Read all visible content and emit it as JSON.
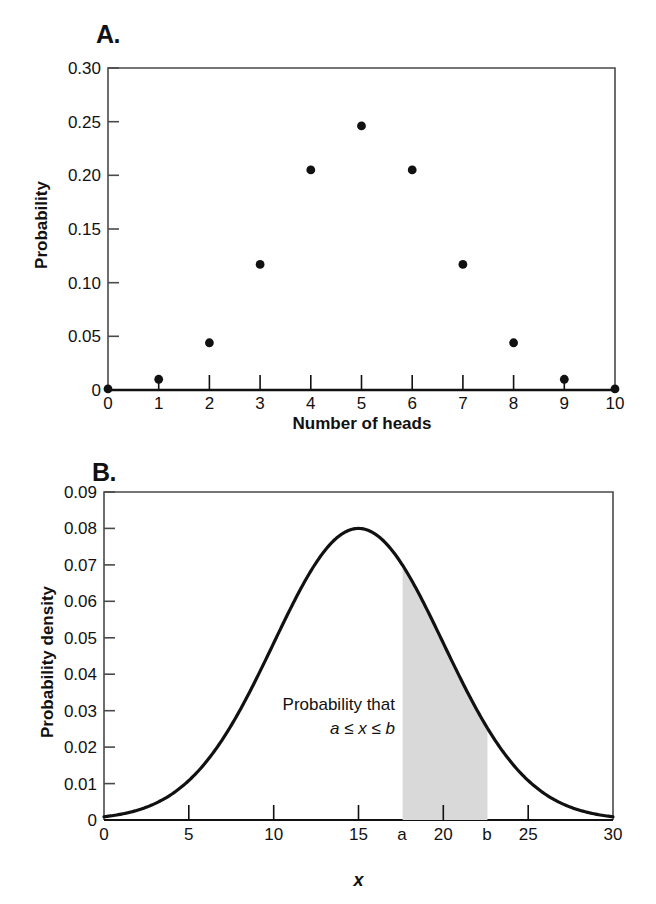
{
  "figure": {
    "panels": [
      {
        "id": "A",
        "label": "A."
      },
      {
        "id": "B",
        "label": "B."
      }
    ]
  },
  "chart_data": [
    {
      "type": "scatter",
      "panel": "A",
      "title": "A.",
      "xlabel": "Number of heads",
      "ylabel": "Probability",
      "xlim": [
        0,
        10
      ],
      "ylim": [
        0,
        0.3
      ],
      "grid": false,
      "legend": "none",
      "x_ticks": [
        "0",
        "1",
        "2",
        "3",
        "4",
        "5",
        "6",
        "7",
        "8",
        "9",
        "10"
      ],
      "y_ticks": [
        "0",
        "0.05",
        "0.10",
        "0.15",
        "0.20",
        "0.25",
        "0.30"
      ],
      "x": [
        0,
        1,
        2,
        3,
        4,
        5,
        6,
        7,
        8,
        9,
        10
      ],
      "values": [
        0.001,
        0.01,
        0.044,
        0.117,
        0.205,
        0.246,
        0.205,
        0.117,
        0.044,
        0.01,
        0.001
      ],
      "marker": "filled-circle",
      "marker_color": "#111111"
    },
    {
      "type": "line",
      "panel": "B",
      "title": "B.",
      "xlabel": "x",
      "ylabel": "Probability density",
      "xlim": [
        0,
        30
      ],
      "ylim": [
        0,
        0.09
      ],
      "grid": false,
      "legend": "none",
      "x_ticks": [
        "0",
        "5",
        "10",
        "15",
        "a",
        "20",
        "b",
        "25",
        "30"
      ],
      "x_tick_values": [
        0,
        5,
        10,
        15,
        17.6,
        20,
        22.6,
        25,
        30
      ],
      "y_ticks": [
        "0",
        "0.01",
        "0.02",
        "0.03",
        "0.04",
        "0.05",
        "0.06",
        "0.07",
        "0.08",
        "0.09"
      ],
      "curve": {
        "distribution": "normal",
        "mean": 15,
        "sigma": 5,
        "peak": 0.08,
        "color": "#111111"
      },
      "shaded_region": {
        "from": 17.6,
        "to": 22.6,
        "from_label": "a",
        "to_label": "b",
        "fill": "#d9d9d9"
      },
      "annotations": [
        {
          "line1": "Probability that",
          "line2": "a ≤ x ≤ b"
        }
      ]
    }
  ],
  "panel_a": {
    "label": "A.",
    "y_axis_title": "Probability",
    "x_axis_title": "Number of heads",
    "y_ticks": [
      "0.30",
      "0.25",
      "0.20",
      "0.15",
      "0.10",
      "0.05",
      "0"
    ],
    "x_ticks": [
      "0",
      "1",
      "2",
      "3",
      "4",
      "5",
      "6",
      "7",
      "8",
      "9",
      "10"
    ]
  },
  "panel_b": {
    "label": "B.",
    "y_axis_title": "Probability density",
    "x_axis_title": "x",
    "y_ticks": [
      "0.09",
      "0.08",
      "0.07",
      "0.06",
      "0.05",
      "0.04",
      "0.03",
      "0.02",
      "0.01",
      "0"
    ],
    "x_ticks": [
      "0",
      "5",
      "10",
      "15",
      "a",
      "20",
      "b",
      "25",
      "30"
    ],
    "annotation_line1": "Probability that",
    "annotation_line2": "a ≤ x ≤ b"
  }
}
